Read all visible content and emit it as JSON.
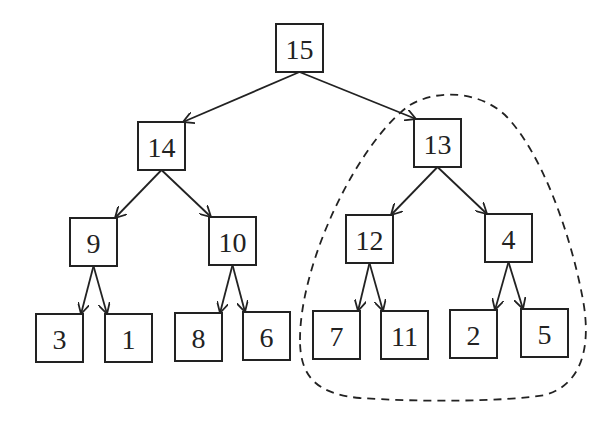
{
  "diagram": {
    "type": "binary-tree (max-heap)",
    "nodes": [
      {
        "id": "n15",
        "label": "15",
        "x": 276,
        "y": 24
      },
      {
        "id": "n14",
        "label": "14",
        "x": 138,
        "y": 122
      },
      {
        "id": "n13",
        "label": "13",
        "x": 414,
        "y": 119
      },
      {
        "id": "n9",
        "label": "9",
        "x": 70,
        "y": 218
      },
      {
        "id": "n10",
        "label": "10",
        "x": 209,
        "y": 217
      },
      {
        "id": "n12",
        "label": "12",
        "x": 346,
        "y": 215
      },
      {
        "id": "n4",
        "label": "4",
        "x": 485,
        "y": 214
      },
      {
        "id": "n3",
        "label": "3",
        "x": 36,
        "y": 314
      },
      {
        "id": "n1",
        "label": "1",
        "x": 105,
        "y": 314
      },
      {
        "id": "n8",
        "label": "8",
        "x": 175,
        "y": 313
      },
      {
        "id": "n6",
        "label": "6",
        "x": 243,
        "y": 312
      },
      {
        "id": "n7",
        "label": "7",
        "x": 313,
        "y": 311
      },
      {
        "id": "n11",
        "label": "11",
        "x": 381,
        "y": 311
      },
      {
        "id": "n2",
        "label": "2",
        "x": 450,
        "y": 310
      },
      {
        "id": "n5",
        "label": "5",
        "x": 521,
        "y": 309
      }
    ],
    "edges": [
      [
        "n15",
        "n14"
      ],
      [
        "n15",
        "n13"
      ],
      [
        "n14",
        "n9"
      ],
      [
        "n14",
        "n10"
      ],
      [
        "n13",
        "n12"
      ],
      [
        "n13",
        "n4"
      ],
      [
        "n9",
        "n3"
      ],
      [
        "n9",
        "n1"
      ],
      [
        "n10",
        "n8"
      ],
      [
        "n10",
        "n6"
      ],
      [
        "n12",
        "n7"
      ],
      [
        "n12",
        "n11"
      ],
      [
        "n4",
        "n2"
      ],
      [
        "n4",
        "n5"
      ]
    ],
    "highlight": {
      "style": "dashed outline",
      "encloses_subtree_root": "13"
    }
  }
}
